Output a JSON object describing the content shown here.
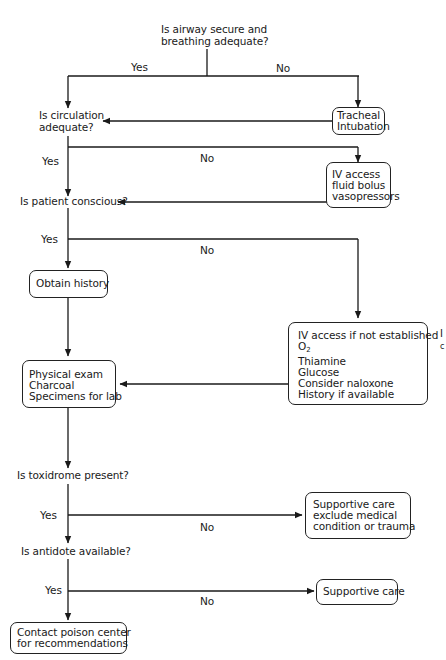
{
  "diagram": {
    "type": "flowchart",
    "decisions": {
      "airway": [
        "Is airway secure and",
        "breathing adequate?"
      ],
      "circulation": [
        "Is circulation",
        "adequate?"
      ],
      "conscious": "Is patient conscious?",
      "toxidrome": "Is toxidrome present?",
      "antidote": "Is antidote available?"
    },
    "actions": {
      "intubation": [
        "Tracheal",
        "Intubation"
      ],
      "iv_fluids": [
        "IV access",
        "fluid bolus",
        "vasopressors"
      ],
      "history": "Obtain history",
      "unconscious_care": {
        "line1": "IV access if not established",
        "o2_main": "O",
        "o2_sub": "2",
        "line3": "Thiamine",
        "line4": "Glucose",
        "line5": "Consider naloxone",
        "line6": "History if available"
      },
      "exam": [
        "Physical exam",
        "Charcoal",
        "Specimens for lab"
      ],
      "supportive_exclude": [
        "Supportive care",
        "exclude medical",
        "condition or trauma"
      ],
      "supportive": "Supportive care",
      "poison_center": [
        "Contact poison center",
        "for recommendations"
      ]
    },
    "edge_labels": {
      "airway_yes": "Yes",
      "airway_no": "No",
      "circulation_yes": "Yes",
      "circulation_no": "No",
      "conscious_yes": "Yes",
      "conscious_no": "No",
      "toxidrome_yes": "Yes",
      "toxidrome_no": "No",
      "antidote_yes": "Yes",
      "antidote_no": "No"
    },
    "clipped_margin_text": [
      "I",
      "c"
    ]
  }
}
